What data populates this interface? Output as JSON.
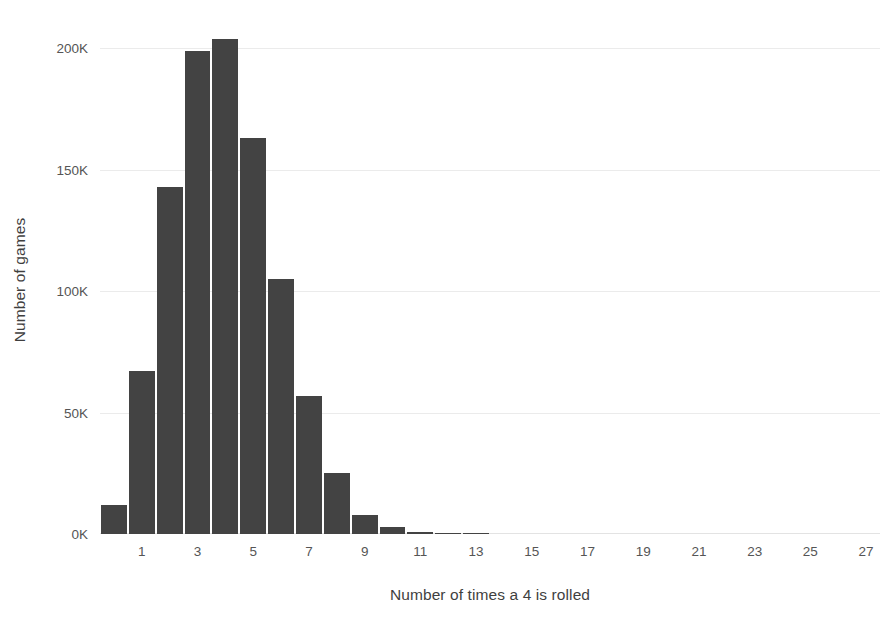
{
  "chart_data": {
    "type": "bar",
    "title": "",
    "xlabel": "Number of times a 4 is rolled",
    "ylabel": "Number of games",
    "categories": [
      0,
      1,
      2,
      3,
      4,
      5,
      6,
      7,
      8,
      9,
      10,
      11,
      12,
      13,
      14,
      15,
      16,
      17,
      18,
      19,
      20,
      21,
      22,
      23,
      24,
      25,
      26,
      27
    ],
    "values": [
      12000,
      67000,
      143000,
      199000,
      204000,
      163000,
      105000,
      57000,
      25000,
      8000,
      3000,
      900,
      300,
      80,
      0,
      0,
      0,
      0,
      0,
      0,
      0,
      0,
      0,
      0,
      0,
      0,
      0,
      0
    ],
    "x_tick_labels": [
      "1",
      "3",
      "5",
      "7",
      "9",
      "11",
      "13",
      "15",
      "17",
      "19",
      "21",
      "23",
      "25",
      "27"
    ],
    "x_tick_positions": [
      1,
      3,
      5,
      7,
      9,
      11,
      13,
      15,
      17,
      19,
      21,
      23,
      25,
      27
    ],
    "y_tick_labels": [
      "0K",
      "50K",
      "100K",
      "150K",
      "200K"
    ],
    "y_tick_values": [
      0,
      50000,
      100000,
      150000,
      200000
    ],
    "ylim": [
      0,
      215000
    ],
    "xlim": [
      -0.5,
      27.5
    ],
    "grid": "horizontal",
    "legend": "none",
    "bar_color": "#434343",
    "grid_color": "#ebebeb",
    "text_color": "#555555"
  }
}
